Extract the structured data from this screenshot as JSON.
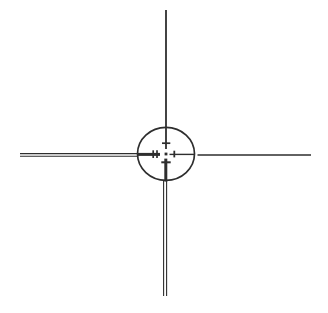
{
  "figure": {
    "background": "#ffffff",
    "ink": "#2e2e2e",
    "canvas": {
      "width": 328,
      "height": 313
    }
  },
  "diagram": {
    "kind": "crosshair-reticle-line-drawing",
    "shapes": [
      {
        "type": "line",
        "name": "crosshair-top-single-line",
        "x1": 166,
        "y1": 10,
        "x2": 166,
        "y2": 149,
        "stroke_width": 1.8
      },
      {
        "type": "line",
        "name": "crosshair-right-single-line",
        "x1": 197.5,
        "y1": 155,
        "x2": 311,
        "y2": 155,
        "stroke_width": 1.6
      },
      {
        "type": "line",
        "name": "crosshair-left-double-line-upper",
        "x1": 20,
        "y1": 153.6,
        "x2": 138,
        "y2": 153.6,
        "stroke_width": 1.1
      },
      {
        "type": "line",
        "name": "crosshair-left-double-line-lower",
        "x1": 20,
        "y1": 156.2,
        "x2": 138,
        "y2": 156.2,
        "stroke_width": 1.1
      },
      {
        "type": "line",
        "name": "crosshair-bottom-double-line-left",
        "x1": 163.6,
        "y1": 181,
        "x2": 163.6,
        "y2": 296,
        "stroke_width": 1.1
      },
      {
        "type": "line",
        "name": "crosshair-bottom-double-line-right",
        "x1": 166.6,
        "y1": 181,
        "x2": 166.6,
        "y2": 296,
        "stroke_width": 1.1
      },
      {
        "type": "ellipse",
        "name": "reticle-circle",
        "cx": 166,
        "cy": 153.8,
        "rx": 28.5,
        "ry": 26.5,
        "stroke_width": 1.7
      },
      {
        "type": "line",
        "name": "inner-left-thick-line",
        "x1": 138,
        "y1": 154.4,
        "x2": 160,
        "y2": 154.4,
        "stroke_width": 3
      },
      {
        "type": "line",
        "name": "inner-right-thin-line",
        "x1": 169.5,
        "y1": 154.4,
        "x2": 194,
        "y2": 154.4,
        "stroke_width": 1.4
      },
      {
        "type": "line",
        "name": "inner-bottom-thick-line",
        "x1": 165.8,
        "y1": 158.6,
        "x2": 165.8,
        "y2": 181.5,
        "stroke_width": 3
      },
      {
        "type": "line",
        "name": "inner-top-tick",
        "x1": 162,
        "y1": 143.2,
        "x2": 170.3,
        "y2": 143.2,
        "stroke_width": 1.7
      },
      {
        "type": "line",
        "name": "inner-bottom-tick",
        "x1": 161.3,
        "y1": 162.3,
        "x2": 170.7,
        "y2": 162.3,
        "stroke_width": 2
      },
      {
        "type": "line",
        "name": "inner-left-tick-outer",
        "x1": 153.2,
        "y1": 150.3,
        "x2": 153.2,
        "y2": 158,
        "stroke_width": 1.7
      },
      {
        "type": "line",
        "name": "inner-left-tick-inner",
        "x1": 157,
        "y1": 150.3,
        "x2": 157,
        "y2": 158,
        "stroke_width": 1.7
      },
      {
        "type": "line",
        "name": "inner-right-tick",
        "x1": 174.3,
        "y1": 150.7,
        "x2": 174.3,
        "y2": 157.4,
        "stroke_width": 1.8
      },
      {
        "type": "rect",
        "name": "center-dot",
        "x": 164.6,
        "y": 152.6,
        "width": 2.8,
        "height": 2.8
      }
    ]
  }
}
